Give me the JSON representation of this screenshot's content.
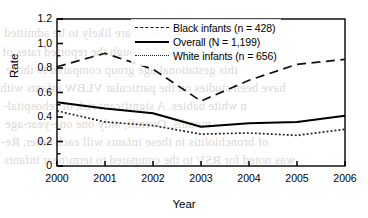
{
  "chart_data": {
    "type": "line",
    "title": "",
    "xlabel": "Year",
    "ylabel": "Rate",
    "x": [
      2000,
      2001,
      2002,
      2003,
      2004,
      2005,
      2006
    ],
    "xtick_labels": [
      "2000",
      "2001",
      "2002",
      "2003",
      "2004",
      "2005",
      "2006"
    ],
    "ytick_labels": [
      "0",
      "0.2",
      "0.4",
      "0.6",
      "0.8",
      "1.0",
      "1.2"
    ],
    "ytick_values": [
      0,
      0.2,
      0.4,
      0.6,
      0.8,
      1.0,
      1.2
    ],
    "yminor_values": [
      0.1,
      0.3,
      0.5,
      0.7,
      0.9,
      1.1
    ],
    "ylim": [
      0,
      1.2
    ],
    "xlim": [
      2000,
      2006
    ],
    "grid": false,
    "legend_position": "top-center",
    "series": [
      {
        "name": "Black infants (n = 428)",
        "style": "dashed",
        "color": "#111111",
        "values": [
          0.81,
          0.92,
          0.79,
          0.53,
          0.7,
          0.83,
          0.87
        ]
      },
      {
        "name": "Overall (N = 1,199)",
        "style": "solid",
        "color": "#000000",
        "values": [
          0.52,
          0.47,
          0.43,
          0.32,
          0.35,
          0.36,
          0.41
        ]
      },
      {
        "name": "White infants (n = 656)",
        "style": "dotted",
        "color": "#222222",
        "values": [
          0.45,
          0.36,
          0.33,
          0.26,
          0.27,
          0.25,
          0.3
        ]
      }
    ]
  },
  "legend": {
    "items": [
      {
        "label": "Black infants (n = 428)",
        "key": "dashed-line-key"
      },
      {
        "label": "Overall (N = 1,199)",
        "key": "solid-line-key"
      },
      {
        "label": "White infants (n = 656)",
        "key": "dotted-line-key"
      }
    ]
  },
  "background_bleed": {
    "lines": [
      "e infected with RSV are likely to be admitted",
      "among studies. Although the reported rates of",
      "this gestational age group compared to those",
      "have been studies on the particular VLBW infants with",
      "n white babies. A significant risk of rehospital-",
      "months. Overall, only one one-year-age",
      "of bronchiolitis in these infants will each other. Re-",
      "was noted for RSV to the compared to term/near infants"
    ]
  }
}
